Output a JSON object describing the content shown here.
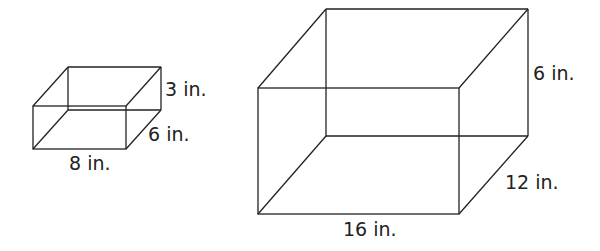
{
  "diagram": {
    "type": "rectangular-prisms",
    "stroke_color": "#222222",
    "background": "#ffffff",
    "boxes": [
      {
        "id": "small-box",
        "length": "8 in.",
        "width": "6 in.",
        "height": "3 in.",
        "labels": {
          "length": "8 in.",
          "width": "6 in.",
          "height": "3 in."
        }
      },
      {
        "id": "large-box",
        "length": "16 in.",
        "width": "12 in.",
        "height": "6 in.",
        "labels": {
          "length": "16 in.",
          "width": "12 in.",
          "height": "6 in."
        }
      }
    ]
  }
}
